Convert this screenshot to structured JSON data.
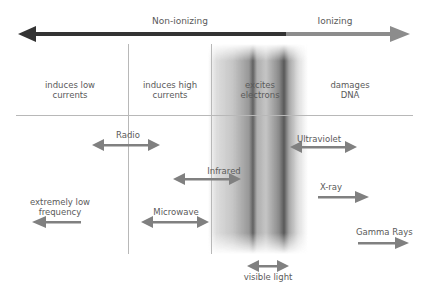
{
  "spectrum": {
    "left_label": "Non-ionizing",
    "right_label": "Ionizing",
    "colors": {
      "non_ionizing": "#333333",
      "ionizing": "#8c8c8c",
      "band_arrow": "#808080",
      "divider": "#b8b8b8"
    }
  },
  "effects": [
    {
      "id": "low-currents",
      "line1": "induces low",
      "line2": "currents"
    },
    {
      "id": "high-currents",
      "line1": "induces high",
      "line2": "currents"
    },
    {
      "id": "excites-electrons",
      "line1": "excites",
      "line2": "electrons"
    },
    {
      "id": "damages-dna",
      "line1": "damages",
      "line2": "DNA"
    }
  ],
  "bands": [
    {
      "id": "elf",
      "line1": "extremely low",
      "line2": "frequency",
      "direction": "left"
    },
    {
      "id": "radio",
      "label": "Radio",
      "direction": "both"
    },
    {
      "id": "microwave",
      "label": "Microwave",
      "direction": "both"
    },
    {
      "id": "infrared",
      "label": "Infrared",
      "direction": "both"
    },
    {
      "id": "visible",
      "label": "visible light",
      "direction": "both"
    },
    {
      "id": "ultraviolet",
      "label": "Ultraviolet",
      "direction": "both"
    },
    {
      "id": "xray",
      "label": "X-ray",
      "direction": "right"
    },
    {
      "id": "gamma",
      "label": "Gamma Rays",
      "direction": "right"
    }
  ]
}
